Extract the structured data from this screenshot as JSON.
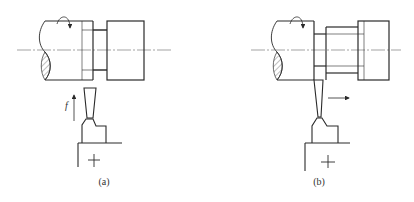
{
  "figure": {
    "panels": [
      {
        "id": "a",
        "caption": "(a)",
        "feed_label": "f",
        "feed_direction": "up",
        "description": "Grooving tool plunging radially into rotating workpiece"
      },
      {
        "id": "b",
        "caption": "(b)",
        "feed_label": "",
        "feed_direction": "right",
        "description": "Tool feeding axially along workpiece after plunge"
      }
    ],
    "colors": {
      "line": "#2a2a2a",
      "centerline": "#555555",
      "hatch": "#444444",
      "background": "#ffffff"
    }
  }
}
